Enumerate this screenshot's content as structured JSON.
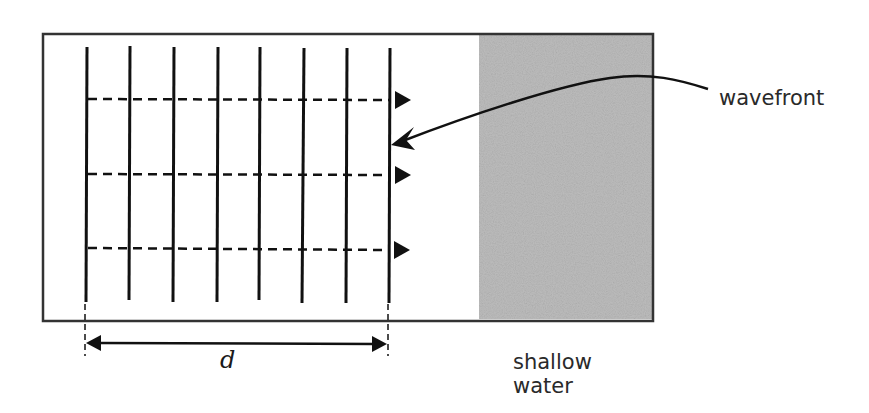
{
  "diagram": {
    "type": "wave-refraction-setup",
    "labels": {
      "wavefront": "wavefront",
      "shallow_line1": "shallow",
      "shallow_line2": "water",
      "distance": "d"
    },
    "tank": {
      "x": 43,
      "y": 33,
      "width": 610,
      "height": 288
    },
    "shallow_region": {
      "x": 479,
      "y": 35,
      "width": 173,
      "height": 284,
      "color": "#bdbdbd"
    },
    "wavefront_count": 8,
    "wavefront_x": [
      86,
      129,
      173,
      217,
      259,
      302,
      346,
      389
    ],
    "ray_y": [
      99,
      174,
      249
    ],
    "colors": {
      "line": "#111111",
      "border": "#333333",
      "shallow": "#bdbdbd"
    }
  }
}
